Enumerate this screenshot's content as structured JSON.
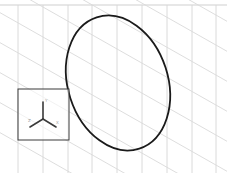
{
  "viewport": {
    "background": "#ffffff",
    "grid_color": "#d4d4d4",
    "border_color": "#cfcfcf",
    "curve_color": "#1a1a1a",
    "triad_box_color": "#3a3a3a"
  },
  "sketch": {
    "shape": "ellipse",
    "cx": 118,
    "cy": 83,
    "rx": 52,
    "ry": 68,
    "rotation": -20
  },
  "view_triad": {
    "axes": {
      "y_label": "Y",
      "x_label": "X",
      "z_label": "Z"
    }
  },
  "icons": {
    "triad": "view-orientation-triad-icon"
  }
}
